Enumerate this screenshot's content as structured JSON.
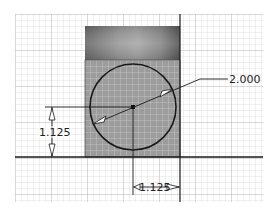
{
  "diagram": {
    "type": "cad-sketch",
    "dimensions": {
      "diameter": "2.000",
      "vertical_offset": "1.125",
      "horizontal_offset": "1.125"
    },
    "colors": {
      "grid_line": "#d9d9d9",
      "grid_major": "#bdbdbd",
      "block_fill": "#9a9a9a",
      "band_dark": "#6e6e6e",
      "band_light": "#a8a8a8",
      "outline": "#1a1a1a"
    }
  }
}
